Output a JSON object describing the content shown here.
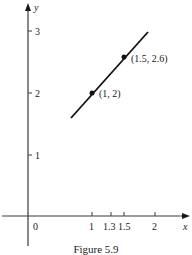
{
  "figure": {
    "caption": "Figure 5.9"
  },
  "axes": {
    "x_label": "x",
    "y_label": "y",
    "origin_label": "0",
    "x_ticks": [
      {
        "value": 1,
        "label": "1"
      },
      {
        "value": 1.3,
        "label": "1.3"
      },
      {
        "value": 1.5,
        "label": "1.5"
      },
      {
        "value": 2,
        "label": "2"
      }
    ],
    "y_ticks": [
      {
        "value": 1,
        "label": "1"
      },
      {
        "value": 2,
        "label": "2"
      },
      {
        "value": 3,
        "label": "3"
      }
    ]
  },
  "points": [
    {
      "x": 1,
      "y": 2,
      "label": "(1, 2)"
    },
    {
      "x": 1.5,
      "y": 2.6,
      "label": "(1.5, 2.6)"
    }
  ],
  "line": {
    "slope": 1.2,
    "from_x": 0.68,
    "to_x": 1.9
  },
  "colors": {
    "ink": "#1a1a1a",
    "background": "#ffffff"
  }
}
